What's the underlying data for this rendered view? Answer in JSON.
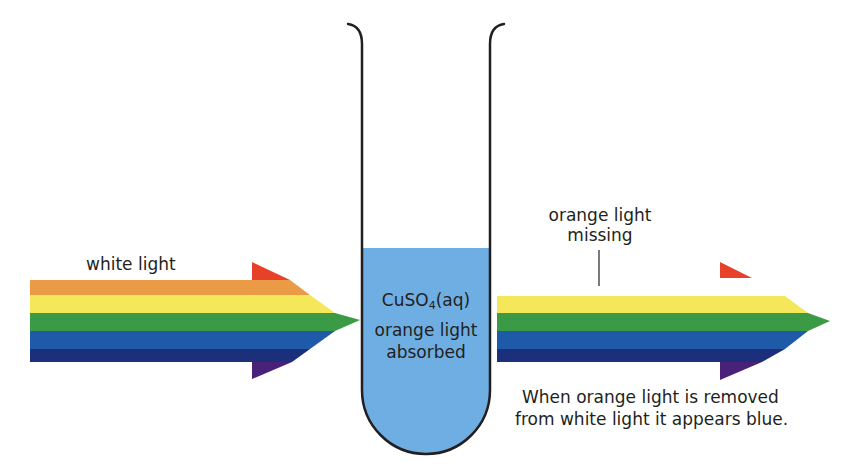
{
  "diagram": {
    "labels": {
      "white_light": "white light",
      "solution_formula_main": "CuSO",
      "solution_formula_sub": "4",
      "solution_formula_state": "(aq)",
      "tube_caption_line1": "orange light",
      "tube_caption_line2": "absorbed",
      "missing_line1": "orange light",
      "missing_line2": "missing",
      "conclusion_line1": "When orange light is removed",
      "conclusion_line2": "from white light it appears blue."
    },
    "colors": {
      "red": "#e8412a",
      "orange": "#eb9a45",
      "yellow": "#f4e85a",
      "green": "#3a9a45",
      "blue": "#1f5aa8",
      "navy": "#1b2f7a",
      "violet": "#4a2179",
      "solution": "#6eaee3",
      "outline": "#231f20"
    },
    "incoming_beam": {
      "name": "white light",
      "bands": [
        "red",
        "orange",
        "yellow",
        "green",
        "blue",
        "navy",
        "violet"
      ]
    },
    "outgoing_beam": {
      "name": "light after absorption",
      "bands": [
        "red",
        "yellow",
        "green",
        "blue",
        "navy",
        "violet"
      ],
      "missing_band": "orange"
    }
  }
}
